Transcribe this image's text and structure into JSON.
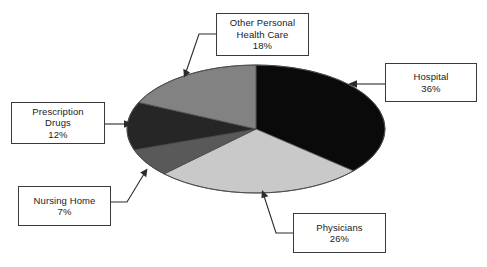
{
  "chart_data": {
    "type": "pie",
    "title": "",
    "subtitle": "",
    "xlabel": "",
    "ylabel": "",
    "legend_position": "callout-labels",
    "grid": false,
    "style": "3d-flattened-ellipse",
    "total_percent": "99%",
    "categories": [
      "Hospital",
      "Physicians",
      "Nursing Home",
      "Prescription Drugs",
      "Other Personal Health Care"
    ],
    "values": [
      36,
      26,
      7,
      12,
      18
    ],
    "value_labels": [
      "36%",
      "26%",
      "7%",
      "12%",
      "18%"
    ],
    "colors": [
      "#0a0a0a",
      "#c9c9c9",
      "#595959",
      "#262626",
      "#828282"
    ],
    "slices": [
      {
        "name": "Hospital",
        "label": "Hospital",
        "value": 36,
        "value_label": "36%",
        "color": "#0a0a0a",
        "start_percent": 0,
        "end_percent": 36
      },
      {
        "name": "Physicians",
        "label": "Physicians",
        "value": 26,
        "value_label": "26%",
        "color": "#c9c9c9",
        "start_percent": 36,
        "end_percent": 62
      },
      {
        "name": "Nursing Home",
        "label": "Nursing Home",
        "value": 7,
        "value_label": "7%",
        "color": "#595959",
        "start_percent": 62,
        "end_percent": 69
      },
      {
        "name": "Prescription Drugs",
        "label": "Prescription\nDrugs",
        "value": 12,
        "value_label": "12%",
        "color": "#262626",
        "start_percent": 69,
        "end_percent": 81
      },
      {
        "name": "Other Personal Health Care",
        "label": "Other Personal\nHealth Care",
        "value": 18,
        "value_label": "18%",
        "color": "#828282",
        "start_percent": 81,
        "end_percent": 99
      }
    ]
  },
  "callouts": {
    "other": {
      "label": "Other Personal\nHealth Care",
      "value": "18%"
    },
    "hospital": {
      "label": "Hospital",
      "value": "36%"
    },
    "prescription_drugs": {
      "label": "Prescription\nDrugs",
      "value": "12%"
    },
    "nursing_home": {
      "label": "Nursing Home",
      "value": "7%"
    },
    "physicians": {
      "label": "Physicians",
      "value": "26%"
    }
  },
  "geometry": {
    "pie_center_x": 256,
    "pie_center_y": 129,
    "pie_radius_x": 129,
    "pie_radius_y": 64
  },
  "colors": {
    "background": "#ffffff",
    "box_border": "#3a3a3a",
    "leader_line": "#2b2b2b",
    "text": "#1a1a1a",
    "pie_outline": "#4a4a4a"
  }
}
